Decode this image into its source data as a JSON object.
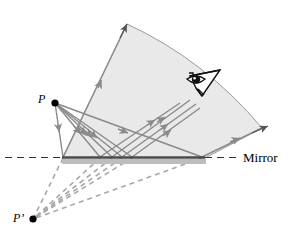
{
  "figure": {
    "labels": {
      "source_point": "P",
      "image_point": "P’",
      "mirror": "Mirror"
    },
    "icons": {
      "eye": "eye-icon"
    },
    "colors": {
      "cone_fill": "#e9e9e9",
      "cone_stroke": "#9a9a9a",
      "ray_solid": "#8a8a8a",
      "ray_dashed": "#a8a8a8",
      "mirror_line": "#4a4a4a",
      "mirror_shadow": "#bdbdbd",
      "plane_dash": "#3a3a3a",
      "point": "#000000",
      "text": "#000000"
    },
    "geometry": {
      "source_point": {
        "x": 55,
        "y": 103
      },
      "image_point": {
        "x": 33,
        "y": 219
      },
      "mirror_line": {
        "x1": 62,
        "y1": 158,
        "x2": 205,
        "y2": 158
      },
      "mirror_plane_dashed_left": {
        "x1": 5,
        "y1": 158,
        "x2": 62,
        "y2": 158
      },
      "mirror_plane_dashed_right": {
        "x1": 205,
        "y1": 158,
        "x2": 240,
        "y2": 158
      },
      "cone_apex_arrow": {
        "x": 127,
        "y": 22
      },
      "cone_right_arrow": {
        "x": 268,
        "y": 133
      },
      "eye_position": {
        "x": 203,
        "y": 88
      },
      "reflection_points": [
        {
          "x": 100,
          "y": 157
        },
        {
          "x": 112,
          "y": 157
        },
        {
          "x": 122,
          "y": 157
        },
        {
          "x": 132,
          "y": 157
        },
        {
          "x": 202,
          "y": 157
        },
        {
          "x": 63,
          "y": 157
        }
      ]
    }
  }
}
